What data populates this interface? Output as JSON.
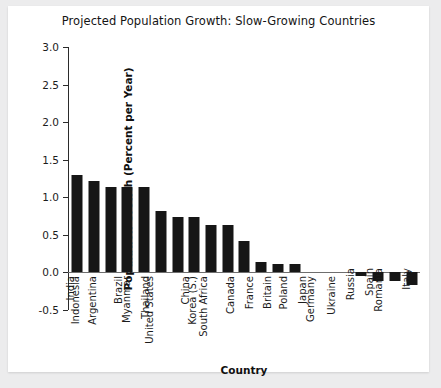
{
  "chart_data": {
    "type": "bar",
    "title": "Projected Population Growth: Slow-Growing Countries",
    "xlabel": "Country",
    "ylabel": "Population Growth (Percent per Year)",
    "ylim": [
      -0.5,
      3.0
    ],
    "yticks": [
      "3.0",
      "2.5",
      "2.0",
      "1.5",
      "1.0",
      "0.5",
      "0.0",
      "-0.5"
    ],
    "ytick_values": [
      3.0,
      2.5,
      2.0,
      1.5,
      1.0,
      0.5,
      0.0,
      -0.5
    ],
    "grid": false,
    "legend": null,
    "bar_color": "#161616",
    "categories": [
      "India",
      "Indonesia",
      "Argentina",
      "Brazil",
      "Myanmar",
      "Thailand",
      "United States",
      "China",
      "Korea (S.)",
      "South Africa",
      "Canada",
      "France",
      "Britain",
      "Poland",
      "Japan",
      "Germany",
      "Ukraine",
      "Russia",
      "Spain",
      "Romania",
      "Italy"
    ],
    "values": [
      1.29,
      1.21,
      1.13,
      1.13,
      1.13,
      0.82,
      0.74,
      0.74,
      0.63,
      0.63,
      0.42,
      0.13,
      0.11,
      0.11,
      0.0,
      0.0,
      0.0,
      -0.05,
      -0.12,
      -0.12,
      -0.17
    ]
  }
}
